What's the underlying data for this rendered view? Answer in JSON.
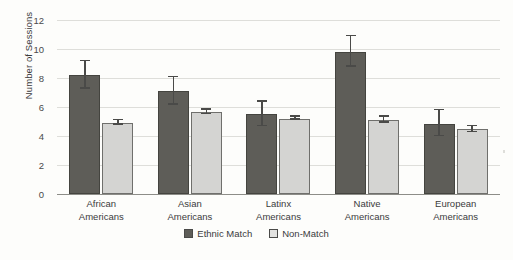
{
  "chart_data": {
    "type": "bar",
    "title": "",
    "xlabel": "",
    "ylabel": "Number of Sessions",
    "ylim": [
      0,
      12
    ],
    "yticks": [
      0,
      2,
      4,
      6,
      8,
      10,
      12
    ],
    "grid": true,
    "legend_position": "bottom-center",
    "categories": [
      "African\nAmericans",
      "Asian\nAmericans",
      "Latinx\nAmericans",
      "Native\nAmericans",
      "European\nAmericans"
    ],
    "category_lines": [
      [
        "African",
        "Americans"
      ],
      [
        "Asian",
        "Americans"
      ],
      [
        "Latinx",
        "Americans"
      ],
      [
        "Native",
        "Americans"
      ],
      [
        "European",
        "Americans"
      ]
    ],
    "series": [
      {
        "name": "Ethnic Match",
        "color": "#5e5d58",
        "values": [
          8.2,
          7.1,
          5.5,
          9.8,
          4.85
        ],
        "errors": [
          1.0,
          1.0,
          0.9,
          1.1,
          0.95
        ]
      },
      {
        "name": "Non-Match",
        "color": "#d4d4d2",
        "values": [
          4.9,
          5.65,
          5.2,
          5.1,
          4.45
        ],
        "errors": [
          0.2,
          0.2,
          0.15,
          0.25,
          0.25
        ]
      }
    ]
  },
  "axis": {
    "y_title": "Number of Sessions",
    "y_tick_labels": [
      "12",
      "10",
      "8",
      "6",
      "4",
      "2",
      "0"
    ]
  },
  "legend": {
    "items": [
      {
        "label": "Ethnic Match",
        "swatch": "match-swatch"
      },
      {
        "label": "Non-Match",
        "swatch": "nonmatch-swatch"
      }
    ]
  }
}
